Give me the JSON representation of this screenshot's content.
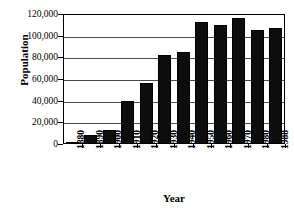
{
  "chart_data": {
    "type": "bar",
    "title": "POPULATION OF JOHNSON COUNTY",
    "xlabel": "Year",
    "ylabel": "Population",
    "categories": [
      "1880",
      "1890",
      "1900",
      "1910",
      "1920",
      "1930",
      "1940",
      "1950",
      "1960",
      "1970",
      "1980",
      "1988"
    ],
    "values": [
      2000,
      8000,
      13000,
      40000,
      56000,
      82000,
      85000,
      113000,
      110000,
      116000,
      105000,
      107000
    ],
    "ylim": [
      0,
      120000
    ],
    "ytick_values": [
      0,
      20000,
      40000,
      60000,
      80000,
      100000,
      120000
    ],
    "ytick_labels": [
      "0",
      "20,000",
      "40,000",
      "60,000",
      "80,000",
      "100,000",
      "120,000"
    ],
    "grid": true,
    "legend": false,
    "bar_color": "#0d0d0d",
    "frame_color": "#000000"
  }
}
